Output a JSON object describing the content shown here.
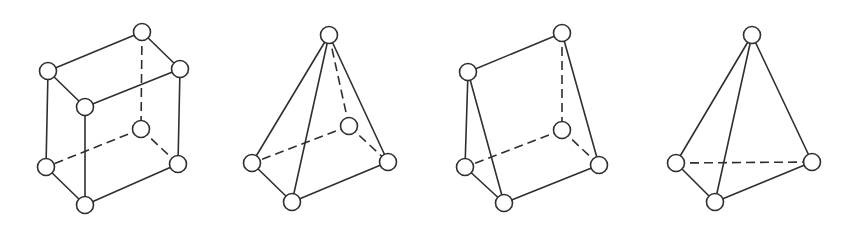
{
  "diagram": {
    "title": "",
    "style": {
      "stroke_color": "#2f2f2f",
      "node_fill": "#ffffff",
      "background": "#ffffff",
      "node_radius": 8.5,
      "dash_pattern": "9 5"
    },
    "shapes": [
      {
        "id": "hexahedron",
        "label": "",
        "nodes": {
          "A": [
            142,
            32
          ],
          "B": [
            48,
            71
          ],
          "C": [
            180,
            69
          ],
          "D": [
            85,
            107
          ],
          "E": [
            141,
            129
          ],
          "F": [
            46,
            167
          ],
          "G": [
            178,
            164
          ],
          "H": [
            85,
            205
          ]
        },
        "edges": [
          [
            "A",
            "B",
            "solid"
          ],
          [
            "A",
            "C",
            "solid"
          ],
          [
            "B",
            "D",
            "solid"
          ],
          [
            "C",
            "D",
            "solid"
          ],
          [
            "B",
            "F",
            "solid"
          ],
          [
            "D",
            "H",
            "solid"
          ],
          [
            "C",
            "G",
            "solid"
          ],
          [
            "F",
            "H",
            "solid"
          ],
          [
            "H",
            "G",
            "solid"
          ],
          [
            "A",
            "E",
            "dashed"
          ],
          [
            "E",
            "F",
            "dashed"
          ],
          [
            "E",
            "G",
            "dashed"
          ]
        ]
      },
      {
        "id": "pyramid",
        "label": "",
        "nodes": {
          "A": [
            329,
            35
          ],
          "E": [
            349,
            126
          ],
          "L": [
            252,
            163
          ],
          "R": [
            388,
            162
          ],
          "F": [
            292,
            202
          ]
        },
        "edges": [
          [
            "A",
            "L",
            "solid"
          ],
          [
            "A",
            "F",
            "solid"
          ],
          [
            "A",
            "R",
            "solid"
          ],
          [
            "L",
            "F",
            "solid"
          ],
          [
            "F",
            "R",
            "solid"
          ],
          [
            "A",
            "E",
            "dashed"
          ],
          [
            "E",
            "L",
            "dashed"
          ],
          [
            "E",
            "R",
            "dashed"
          ]
        ]
      },
      {
        "id": "wedge",
        "label": "",
        "nodes": {
          "T": [
            562,
            33
          ],
          "U": [
            468,
            72
          ],
          "E": [
            562,
            130
          ],
          "L": [
            465,
            167
          ],
          "R": [
            599,
            165
          ],
          "F": [
            504,
            203
          ]
        },
        "edges": [
          [
            "U",
            "T",
            "solid"
          ],
          [
            "U",
            "L",
            "solid"
          ],
          [
            "U",
            "F",
            "solid"
          ],
          [
            "T",
            "R",
            "solid"
          ],
          [
            "L",
            "F",
            "solid"
          ],
          [
            "F",
            "R",
            "solid"
          ],
          [
            "T",
            "E",
            "dashed"
          ],
          [
            "E",
            "L",
            "dashed"
          ],
          [
            "E",
            "R",
            "dashed"
          ]
        ]
      },
      {
        "id": "tetrahedron",
        "label": "",
        "nodes": {
          "A": [
            752,
            35
          ],
          "L": [
            676,
            163
          ],
          "R": [
            812,
            162
          ],
          "F": [
            715,
            202
          ]
        },
        "edges": [
          [
            "A",
            "L",
            "solid"
          ],
          [
            "A",
            "F",
            "solid"
          ],
          [
            "A",
            "R",
            "solid"
          ],
          [
            "L",
            "F",
            "solid"
          ],
          [
            "F",
            "R",
            "solid"
          ],
          [
            "L",
            "R",
            "dashed"
          ]
        ]
      }
    ]
  }
}
